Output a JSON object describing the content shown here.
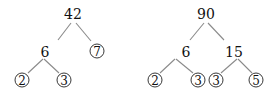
{
  "trees": [
    {
      "name": "factor-tree-42",
      "root": "42",
      "nodes": [
        {
          "id": "n42",
          "label": "42",
          "x": 73,
          "y": 14,
          "prime": false
        },
        {
          "id": "n6",
          "label": "6",
          "x": 45,
          "y": 52,
          "prime": false
        },
        {
          "id": "n7",
          "label": "7",
          "x": 97,
          "y": 51,
          "prime": true
        },
        {
          "id": "n2",
          "label": "2",
          "x": 22,
          "y": 80,
          "prime": true
        },
        {
          "id": "n3",
          "label": "3",
          "x": 64,
          "y": 80,
          "prime": true
        }
      ]
    },
    {
      "name": "factor-tree-90",
      "root": "90",
      "nodes": [
        {
          "id": "m90",
          "label": "90",
          "x": 206,
          "y": 14,
          "prime": false
        },
        {
          "id": "m6",
          "label": "6",
          "x": 186,
          "y": 52,
          "prime": false
        },
        {
          "id": "m15",
          "label": "15",
          "x": 234,
          "y": 52,
          "prime": false
        },
        {
          "id": "m2",
          "label": "2",
          "x": 155,
          "y": 80,
          "prime": true
        },
        {
          "id": "m3a",
          "label": "3",
          "x": 198,
          "y": 80,
          "prime": true
        },
        {
          "id": "m3b",
          "label": "3",
          "x": 216,
          "y": 80,
          "prime": true
        },
        {
          "id": "m5",
          "label": "5",
          "x": 256,
          "y": 80,
          "prime": true
        }
      ]
    }
  ],
  "labels": {
    "t1_root": "42",
    "t1_mid": "6",
    "t1_prime7": "7",
    "t1_prime2": "2",
    "t1_prime3": "3",
    "t2_root": "90",
    "t2_mid6": "6",
    "t2_mid15": "15",
    "t2_prime2": "2",
    "t2_prime3a": "3",
    "t2_prime3b": "3",
    "t2_prime5": "5"
  }
}
